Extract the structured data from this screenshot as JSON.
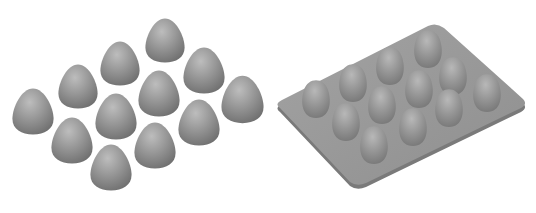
{
  "figure": {
    "panels": [
      {
        "id": "left",
        "label": "Loose eggs arranged in 3x4 grid",
        "egg_count": 12,
        "eggs": [
          {
            "cx": 165,
            "cy": 40,
            "rx": 20,
            "ry": 32
          },
          {
            "cx": 120,
            "cy": 63,
            "rx": 20,
            "ry": 32
          },
          {
            "cx": 78,
            "cy": 86,
            "rx": 20,
            "ry": 32
          },
          {
            "cx": 33,
            "cy": 111,
            "rx": 21,
            "ry": 34
          },
          {
            "cx": 203,
            "cy": 70,
            "rx": 21,
            "ry": 32
          },
          {
            "cx": 159,
            "cy": 93,
            "rx": 21,
            "ry": 32
          },
          {
            "cx": 116,
            "cy": 116,
            "rx": 21,
            "ry": 32
          },
          {
            "cx": 72,
            "cy": 140,
            "rx": 21,
            "ry": 33
          },
          {
            "cx": 242,
            "cy": 99,
            "rx": 21,
            "ry": 34
          },
          {
            "cx": 199,
            "cy": 122,
            "rx": 21,
            "ry": 33
          },
          {
            "cx": 155,
            "cy": 145,
            "rx": 21,
            "ry": 33
          },
          {
            "cx": 111,
            "cy": 167,
            "rx": 21,
            "ry": 33
          }
        ]
      },
      {
        "id": "right",
        "label": "Egg tray with 12 egg-shaped bumps",
        "egg_count": 12
      }
    ],
    "colors": {
      "background": "#ffffff",
      "egg_light": "#b4b4b4",
      "egg_mid": "#8e8e8e",
      "egg_dark": "#6e6e6e",
      "tray_top": "#9a9a9a",
      "tray_edge": "#7c7c7c"
    }
  }
}
